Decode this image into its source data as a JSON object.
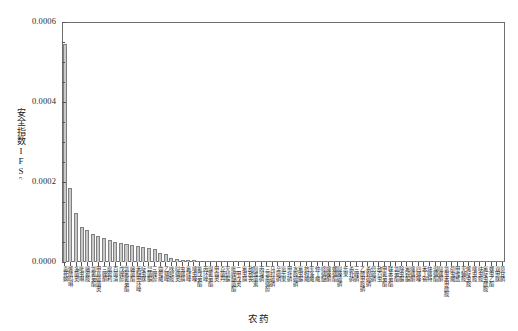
{
  "chart_data": {
    "type": "bar",
    "title": "",
    "subtitle": "",
    "xlabel": "农药",
    "ylabel_main": "安全指数IFS",
    "ylabel_sub": "c",
    "ylim": [
      0,
      0.0006
    ],
    "ytick_labels": [
      "0.0000",
      "0.0002",
      "0.0004",
      "0.0006"
    ],
    "ytick_values": [
      0,
      0.0002,
      0.0004,
      0.0006
    ],
    "yminor_values": [
      5e-05,
      0.0001,
      0.00015,
      0.00025,
      0.0003,
      0.00035,
      0.00045,
      0.0005,
      0.00055
    ],
    "grid": false,
    "legend": "none",
    "bar_fill": "#c9c9c9",
    "bar_edge": "#808080",
    "axis_color": "#6f6f6f",
    "categories": [
      "毒死蜱",
      "烯酰吗啉",
      "多菌灵",
      "吡虫啉",
      "嘧霉胺",
      "氯氰菊酯",
      "甲基硫菌灵",
      "三唑酮",
      "腐霉利",
      "百菌清",
      "戊唑醇",
      "氯氟氰菊酯",
      "嘧菌酯",
      "苯醚甲环唑",
      "啶虫脒",
      "异菌脲",
      "三唑醇",
      "霜霉威",
      "乙螨唑",
      "咪鲜胺",
      "哒螨灵",
      "虫螨腈",
      "氟硅唑",
      "噻虫嗪",
      "氰戊菊酯",
      "丙环唑",
      "溴氰菊酯",
      "甲霜灵",
      "克菌丹",
      "灭幼脲",
      "吡唑醚菌酯",
      "二甲戊灵",
      "氟虫腈",
      "敌敌畏",
      "阿维菌素",
      "丙溴磷",
      "三氯杀螨醇",
      "马拉硫磷",
      "辛硫磷",
      "氧乐果",
      "甲拌磷",
      "水胺硫磷",
      "氟虫脲",
      "抗蚜威",
      "灭多威",
      "仲丁威",
      "喹螨醚",
      "噻嗪酮",
      "螺螨酯",
      "哒嗪硫磷",
      "乐果",
      "杀扑磷",
      "三唑磷",
      "乙酰甲胺磷",
      "杀螟硫磷",
      "倍硫磷",
      "敌百虫",
      "甲氰菊酯",
      "联苯菊酯",
      "氯菊酯",
      "除虫脲",
      "氟铃脲",
      "噻螨酮",
      "四螨嗪",
      "苯丁锡",
      "炔螨特",
      "溴螨酯",
      "哒螨酮",
      "氯虫苯甲酰胺",
      "茚虫威",
      "甲维盐",
      "灭蝇胺",
      "烯啶虫胺",
      "噻虫胺",
      "呋虫胺",
      "氟啶虫酰胺",
      "螺虫乙酯",
      "双甲脒",
      "草甘膦"
    ],
    "values": [
      0.000545,
      0.000185,
      0.000123,
      8.8e-05,
      7.9e-05,
      6.9e-05,
      6.4e-05,
      5.9e-05,
      5.45e-05,
      5.05e-05,
      4.7e-05,
      4.4e-05,
      4.2e-05,
      3.95e-05,
      3.65e-05,
      3.4e-05,
      3.2e-05,
      2.3e-05,
      1.95e-05,
      1.1e-05,
      7.5e-06,
      5.8e-06,
      4.8e-06,
      4.2e-06,
      3.7e-06,
      3.3e-06,
      3e-06,
      2.7e-06,
      2.5e-06,
      2.3e-06,
      2.1e-06,
      1.9e-06,
      1.8e-06,
      1.7e-06,
      1.6e-06,
      1.5e-06,
      1.4e-06,
      1.3e-06,
      1.2e-06,
      1.2e-06,
      1.1e-06,
      1e-06,
      9.8e-07,
      9.2e-07,
      8.7e-07,
      8.2e-07,
      7.7e-07,
      7.3e-07,
      6.9e-07,
      6.5e-07,
      6.1e-07,
      5.8e-07,
      5.4e-07,
      5.1e-07,
      4.8e-07,
      4.5e-07,
      4.2e-07,
      3.9e-07,
      3.7e-07,
      3.4e-07,
      3.2e-07,
      3e-07,
      2.8e-07,
      2.6e-07,
      2.4e-07,
      2.2e-07,
      2e-07,
      1.9e-07,
      1.7e-07,
      1.6e-07,
      1.4e-07,
      1.3e-07,
      1.2e-07,
      1e-07,
      9e-08,
      8e-08,
      6e-08,
      5e-08,
      3e-08
    ]
  }
}
